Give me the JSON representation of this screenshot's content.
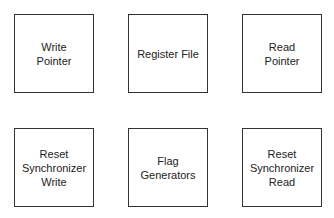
{
  "diagram": {
    "blocks": [
      {
        "id": "write-pointer",
        "label": "Write\nPointer"
      },
      {
        "id": "register-file",
        "label": "Register File"
      },
      {
        "id": "read-pointer",
        "label": "Read\nPointer"
      },
      {
        "id": "reset-synchronizer-write",
        "label": "Reset\nSynchronizer\nWrite"
      },
      {
        "id": "flag-generators",
        "label": "Flag\nGenerators"
      },
      {
        "id": "reset-synchronizer-read",
        "label": "Reset\nSynchronizer\nRead"
      }
    ],
    "colors": {
      "border": "#333333",
      "text": "#222222",
      "background": "#ffffff"
    }
  }
}
